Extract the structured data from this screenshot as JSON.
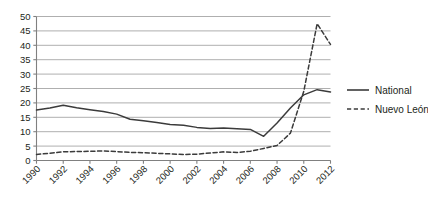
{
  "chart_data": {
    "type": "line",
    "title": "",
    "subtitle": "",
    "xlabel": "",
    "ylabel": "",
    "ylim": [
      0,
      50
    ],
    "ytick_values": [
      0,
      5,
      10,
      15,
      20,
      25,
      30,
      35,
      40,
      45,
      50
    ],
    "ytick_labels": [
      "0",
      "5",
      "10",
      "15",
      "20",
      "25",
      "30",
      "35",
      "40",
      "45",
      "50"
    ],
    "xlim": [
      1990,
      2012
    ],
    "xtick_values": [
      1990,
      1992,
      1994,
      1996,
      1998,
      2000,
      2002,
      2004,
      2006,
      2008,
      2010,
      2012
    ],
    "xtick_labels": [
      "1990",
      "1992",
      "1994",
      "1996",
      "1998",
      "2000",
      "2002",
      "2004",
      "2006",
      "2008",
      "2010",
      "2012"
    ],
    "grid": "horizontal",
    "legend_position": "right",
    "x": [
      1990,
      1991,
      1992,
      1993,
      1994,
      1995,
      1996,
      1997,
      1998,
      1999,
      2000,
      2001,
      2002,
      2003,
      2004,
      2005,
      2006,
      2007,
      2008,
      2009,
      2010,
      2011,
      2012
    ],
    "series": [
      {
        "name": "National",
        "style": "solid",
        "color": "#3b3b3b",
        "values": [
          17.5,
          18.2,
          19.2,
          18.3,
          17.6,
          17.0,
          16.1,
          14.3,
          13.8,
          13.2,
          12.5,
          12.2,
          11.5,
          11.1,
          11.3,
          11.0,
          10.8,
          8.4,
          13.0,
          18.2,
          22.8,
          24.6,
          23.8
        ]
      },
      {
        "name": "Nuevo León",
        "style": "dashed",
        "color": "#3b3b3b",
        "values": [
          2.1,
          2.5,
          3.0,
          3.1,
          3.2,
          3.3,
          3.1,
          2.8,
          2.7,
          2.5,
          2.3,
          2.1,
          2.2,
          2.6,
          3.0,
          2.8,
          3.2,
          4.2,
          5.2,
          9.5,
          24.0,
          47.5,
          40.3
        ]
      }
    ]
  },
  "legend": {
    "items": [
      {
        "label": "National",
        "style": "solid"
      },
      {
        "label": "Nuevo León",
        "style": "dashed"
      }
    ]
  },
  "colors": {
    "line": "#3b3b3b",
    "grid": "#a6a6a6",
    "axis": "#808080",
    "text": "#231f20",
    "background": "#ffffff"
  }
}
